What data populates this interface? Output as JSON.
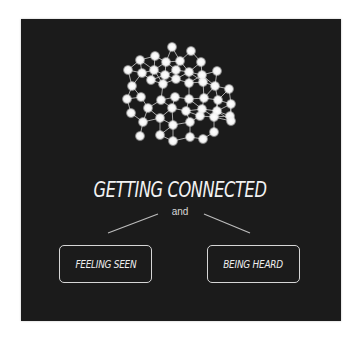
{
  "title": "GETTING CONNECTED",
  "connector": "and",
  "boxes": [
    {
      "label": "FEELING SEEN"
    },
    {
      "label": "BEING HEARD"
    }
  ],
  "colors": {
    "background": "#ffffff",
    "panel": "#1b1b1b",
    "text": "#f2f2f2",
    "node": "#f5f5f5",
    "edge": "#bdbdbd"
  },
  "network": {
    "nodes": [
      [
        172,
        47
      ],
      [
        191,
        51
      ],
      [
        140,
        60
      ],
      [
        155,
        56
      ],
      [
        166,
        62
      ],
      [
        180,
        61
      ],
      [
        201,
        62
      ],
      [
        128,
        70
      ],
      [
        142,
        73
      ],
      [
        154,
        70
      ],
      [
        165,
        75
      ],
      [
        176,
        70
      ],
      [
        189,
        72
      ],
      [
        202,
        75
      ],
      [
        217,
        71
      ],
      [
        132,
        86
      ],
      [
        151,
        80
      ],
      [
        163,
        84
      ],
      [
        176,
        79
      ],
      [
        189,
        83
      ],
      [
        203,
        82
      ],
      [
        215,
        86
      ],
      [
        229,
        89
      ],
      [
        127,
        99
      ],
      [
        141,
        97
      ],
      [
        161,
        100
      ],
      [
        175,
        97
      ],
      [
        189,
        99
      ],
      [
        204,
        98
      ],
      [
        218,
        100
      ],
      [
        231,
        104
      ],
      [
        131,
        113
      ],
      [
        148,
        108
      ],
      [
        172,
        108
      ],
      [
        186,
        111
      ],
      [
        202,
        109
      ],
      [
        217,
        111
      ],
      [
        230,
        116
      ],
      [
        143,
        122
      ],
      [
        160,
        118
      ],
      [
        173,
        125
      ],
      [
        190,
        122
      ],
      [
        200,
        116
      ],
      [
        214,
        117
      ],
      [
        231,
        121
      ],
      [
        140,
        136
      ],
      [
        160,
        135
      ],
      [
        173,
        141
      ],
      [
        190,
        137
      ],
      [
        203,
        139
      ],
      [
        214,
        132
      ]
    ]
  }
}
